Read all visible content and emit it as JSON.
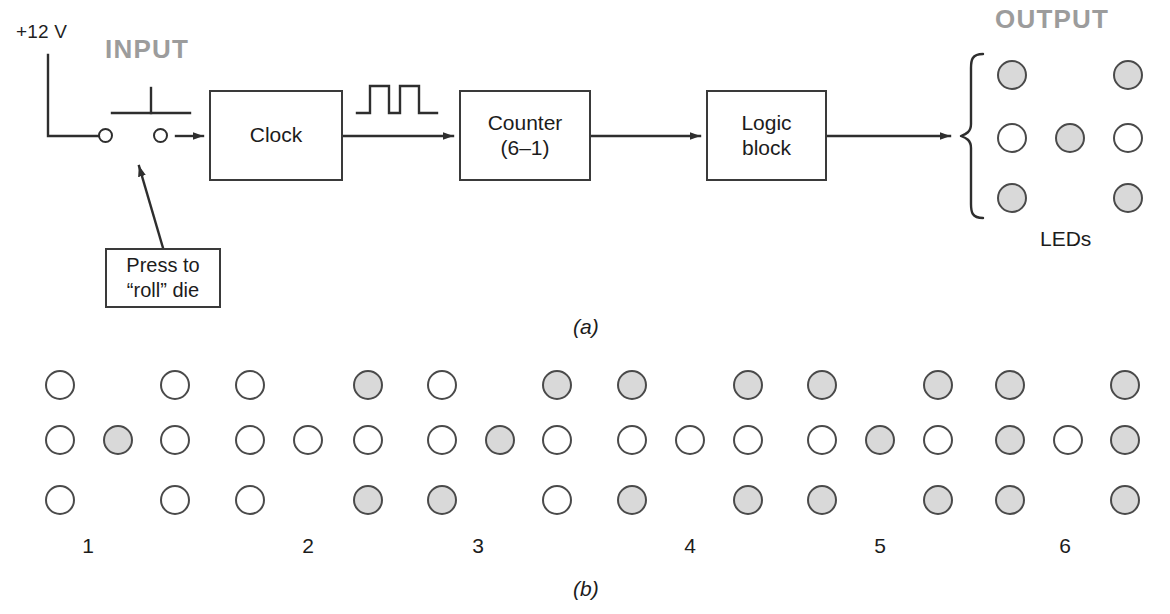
{
  "figure": {
    "panel_a_label": "(a)",
    "panel_b_label": "(b)"
  },
  "panel_a": {
    "supply_label": "+12 V",
    "input_label": "INPUT",
    "output_label": "OUTPUT",
    "callout_text": "Press to\n“roll” die",
    "leds_label": "LEDs",
    "blocks": [
      {
        "id": "clock",
        "label": "Clock"
      },
      {
        "id": "counter",
        "label": "Counter\n(6–1)"
      },
      {
        "id": "logic",
        "label": "Logic\nblock"
      }
    ],
    "waveform_name": "clock-pulse-waveform",
    "switch_name": "push-button-switch",
    "output_led_pattern": {
      "value": 5,
      "pips": [
        "on",
        "off",
        "on",
        "off",
        "on",
        "off",
        "on",
        "off",
        "on"
      ],
      "grid_note": "3 rows x 3 columns; center column only has a middle pip"
    },
    "colors": {
      "line": "#2e2e2e",
      "section_label": "#9c9c9c",
      "pip_on": "#d9d9d9",
      "pip_off": "#ffffff",
      "pip_border": "#4a4a4a"
    }
  },
  "panel_b": {
    "caption": "Die face patterns for values 1 through 6",
    "dice": [
      {
        "number": "1",
        "label": "1",
        "pips": {
          "top_left": "off",
          "top_right": "off",
          "mid_left": "off",
          "center": "on",
          "mid_right": "off",
          "bottom_left": "off",
          "bottom_right": "off"
        }
      },
      {
        "number": "2",
        "label": "2",
        "pips": {
          "top_left": "off",
          "top_right": "on",
          "mid_left": "off",
          "center": "off",
          "mid_right": "off",
          "bottom_left": "off",
          "bottom_right": "on"
        }
      },
      {
        "number": "3",
        "label": "3",
        "pips": {
          "top_left": "off",
          "top_right": "on",
          "mid_left": "off",
          "center": "on",
          "mid_right": "off",
          "bottom_left": "on",
          "bottom_right": "off"
        }
      },
      {
        "number": "4",
        "label": "4",
        "pips": {
          "top_left": "on",
          "top_right": "on",
          "mid_left": "off",
          "center": "off",
          "mid_right": "off",
          "bottom_left": "on",
          "bottom_right": "on"
        }
      },
      {
        "number": "5",
        "label": "5",
        "pips": {
          "top_left": "on",
          "top_right": "on",
          "mid_left": "off",
          "center": "on",
          "mid_right": "off",
          "bottom_left": "on",
          "bottom_right": "on"
        }
      },
      {
        "number": "6",
        "label": "6",
        "pips": {
          "top_left": "on",
          "top_right": "on",
          "mid_left": "on",
          "center": "off",
          "mid_right": "on",
          "bottom_left": "on",
          "bottom_right": "on"
        }
      }
    ]
  }
}
